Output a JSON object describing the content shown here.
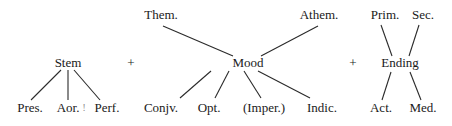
{
  "diagram": {
    "groups": [
      {
        "head": "Stem",
        "above": [],
        "below": [
          "Pres.",
          "Aor.",
          "Perf."
        ],
        "mark": "!"
      },
      {
        "head": "Mood",
        "above": [
          "Them.",
          "Athem."
        ],
        "below": [
          "Conjv.",
          "Opt.",
          "(Imper.)",
          "Indic."
        ]
      },
      {
        "head": "Ending",
        "above": [
          "Prim.",
          "Sec."
        ],
        "below": [
          "Act.",
          "Med."
        ]
      }
    ],
    "operators": [
      "+",
      "+"
    ],
    "colors": {
      "text": "#1a1a1a",
      "line": "#2a2a2a",
      "background": "#ffffff"
    }
  }
}
